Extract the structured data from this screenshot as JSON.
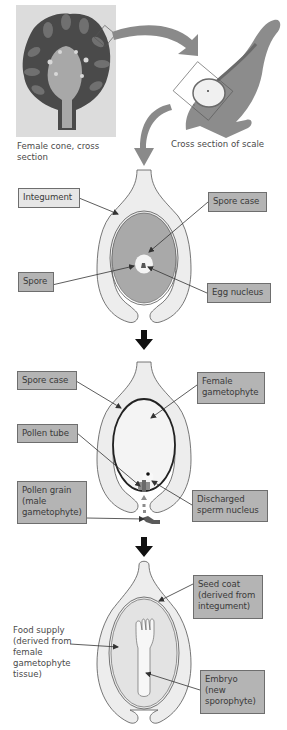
{
  "figure": {
    "top": {
      "cone_caption": "Female cone, cross\nsection",
      "scale_caption": "Cross section of scale"
    },
    "ovule": {
      "labels": {
        "integument": "Integument",
        "spore_case": "Spore case",
        "spore": "Spore",
        "egg_nucleus": "Egg nucleus"
      }
    },
    "pollination": {
      "labels": {
        "spore_case": "Spore case",
        "female_gametophyte": "Female\ngametophyte",
        "pollen_tube": "Pollen tube",
        "pollen_grain": "Pollen grain\n(male\ngametophyte)",
        "discharged_sperm": "Discharged\nsperm nucleus"
      }
    },
    "seed": {
      "labels": {
        "seed_coat": "Seed coat\n(derived from\nintegument)",
        "food_supply": "Food supply\n(derived from\nfemale\ngametophyte\ntissue)",
        "embryo": "Embryo\n(new\nsporophyte)"
      }
    },
    "colors": {
      "label_dark": "#b4b4b4",
      "label_light": "#e6e6e6",
      "tissue_light": "#ececec",
      "tissue_mid": "#a9a9a9",
      "arrow_gray": "#8a8a8a",
      "step_arrow": "#111111"
    }
  }
}
